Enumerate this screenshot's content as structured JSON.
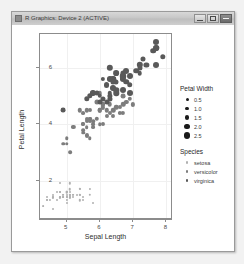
{
  "window": {
    "title": "R Graphics: Device 2 (ACTIVE)",
    "buttons": {
      "minimize": "Minimize",
      "maximize": "Maximize",
      "close": "Close"
    }
  },
  "legends": {
    "size": {
      "title": "Petal Width",
      "entries": [
        {
          "label": "0.5",
          "value": 0.5,
          "px": 3.0
        },
        {
          "label": "1.0",
          "value": 1.0,
          "px": 3.8
        },
        {
          "label": "1.5",
          "value": 1.5,
          "px": 4.6
        },
        {
          "label": "2.0",
          "value": 2.0,
          "px": 5.4
        },
        {
          "label": "2.5",
          "value": 2.5,
          "px": 6.2
        }
      ]
    },
    "color": {
      "title": "Species",
      "entries": [
        {
          "label": "setosa",
          "color": "#b0b0b0"
        },
        {
          "label": "versicolor",
          "color": "#7d7d7d"
        },
        {
          "label": "virginica",
          "color": "#595959"
        }
      ]
    }
  },
  "chart_data": {
    "type": "scatter",
    "title": "",
    "xlabel": "Sepal Length",
    "ylabel": "Petal Length",
    "xlim": [
      4.2,
      8.2
    ],
    "ylim": [
      0.6,
      7.2
    ],
    "xticks": [
      5,
      6,
      7,
      8
    ],
    "yticks": [
      2,
      4,
      6
    ],
    "grid": true,
    "legend_position": "right",
    "size_encoding": "Petal Width",
    "color_encoding": "Species",
    "series": [
      {
        "name": "setosa",
        "color": "#b0b0b0",
        "points": [
          {
            "x": 5.1,
            "y": 1.4,
            "w": 0.2
          },
          {
            "x": 4.9,
            "y": 1.4,
            "w": 0.2
          },
          {
            "x": 4.7,
            "y": 1.3,
            "w": 0.2
          },
          {
            "x": 4.6,
            "y": 1.5,
            "w": 0.2
          },
          {
            "x": 5.0,
            "y": 1.4,
            "w": 0.2
          },
          {
            "x": 5.4,
            "y": 1.7,
            "w": 0.4
          },
          {
            "x": 4.6,
            "y": 1.4,
            "w": 0.3
          },
          {
            "x": 5.0,
            "y": 1.5,
            "w": 0.2
          },
          {
            "x": 4.4,
            "y": 1.4,
            "w": 0.2
          },
          {
            "x": 4.9,
            "y": 1.5,
            "w": 0.1
          },
          {
            "x": 5.4,
            "y": 1.5,
            "w": 0.2
          },
          {
            "x": 4.8,
            "y": 1.6,
            "w": 0.2
          },
          {
            "x": 4.8,
            "y": 1.4,
            "w": 0.1
          },
          {
            "x": 4.3,
            "y": 1.1,
            "w": 0.1
          },
          {
            "x": 5.8,
            "y": 1.2,
            "w": 0.2
          },
          {
            "x": 5.7,
            "y": 1.5,
            "w": 0.4
          },
          {
            "x": 5.4,
            "y": 1.3,
            "w": 0.4
          },
          {
            "x": 5.1,
            "y": 1.4,
            "w": 0.3
          },
          {
            "x": 5.7,
            "y": 1.7,
            "w": 0.3
          },
          {
            "x": 5.1,
            "y": 1.5,
            "w": 0.3
          },
          {
            "x": 5.4,
            "y": 1.7,
            "w": 0.2
          },
          {
            "x": 5.1,
            "y": 1.5,
            "w": 0.4
          },
          {
            "x": 4.6,
            "y": 1.0,
            "w": 0.2
          },
          {
            "x": 5.1,
            "y": 1.7,
            "w": 0.5
          },
          {
            "x": 4.8,
            "y": 1.9,
            "w": 0.2
          },
          {
            "x": 5.0,
            "y": 1.6,
            "w": 0.2
          },
          {
            "x": 5.0,
            "y": 1.6,
            "w": 0.4
          },
          {
            "x": 5.2,
            "y": 1.5,
            "w": 0.2
          },
          {
            "x": 5.2,
            "y": 1.4,
            "w": 0.2
          },
          {
            "x": 4.7,
            "y": 1.6,
            "w": 0.2
          },
          {
            "x": 4.8,
            "y": 1.6,
            "w": 0.2
          },
          {
            "x": 5.4,
            "y": 1.5,
            "w": 0.4
          },
          {
            "x": 5.2,
            "y": 1.5,
            "w": 0.1
          },
          {
            "x": 5.5,
            "y": 1.4,
            "w": 0.2
          },
          {
            "x": 4.9,
            "y": 1.5,
            "w": 0.2
          },
          {
            "x": 5.0,
            "y": 1.2,
            "w": 0.2
          },
          {
            "x": 5.5,
            "y": 1.3,
            "w": 0.2
          },
          {
            "x": 4.9,
            "y": 1.4,
            "w": 0.1
          },
          {
            "x": 4.4,
            "y": 1.3,
            "w": 0.2
          },
          {
            "x": 5.1,
            "y": 1.5,
            "w": 0.2
          },
          {
            "x": 5.0,
            "y": 1.3,
            "w": 0.3
          },
          {
            "x": 4.5,
            "y": 1.3,
            "w": 0.3
          },
          {
            "x": 4.4,
            "y": 1.3,
            "w": 0.2
          },
          {
            "x": 5.0,
            "y": 1.6,
            "w": 0.6
          },
          {
            "x": 5.1,
            "y": 1.9,
            "w": 0.4
          },
          {
            "x": 4.8,
            "y": 1.4,
            "w": 0.3
          },
          {
            "x": 5.1,
            "y": 1.6,
            "w": 0.2
          },
          {
            "x": 4.6,
            "y": 1.4,
            "w": 0.2
          },
          {
            "x": 5.3,
            "y": 1.5,
            "w": 0.2
          },
          {
            "x": 5.0,
            "y": 1.4,
            "w": 0.2
          }
        ]
      },
      {
        "name": "versicolor",
        "color": "#7d7d7d",
        "points": [
          {
            "x": 7.0,
            "y": 4.7,
            "w": 1.4
          },
          {
            "x": 6.4,
            "y": 4.5,
            "w": 1.5
          },
          {
            "x": 6.9,
            "y": 4.9,
            "w": 1.5
          },
          {
            "x": 5.5,
            "y": 4.0,
            "w": 1.3
          },
          {
            "x": 6.5,
            "y": 4.6,
            "w": 1.5
          },
          {
            "x": 5.7,
            "y": 4.5,
            "w": 1.3
          },
          {
            "x": 6.3,
            "y": 4.7,
            "w": 1.6
          },
          {
            "x": 4.9,
            "y": 3.3,
            "w": 1.0
          },
          {
            "x": 6.6,
            "y": 4.6,
            "w": 1.3
          },
          {
            "x": 5.2,
            "y": 3.9,
            "w": 1.4
          },
          {
            "x": 5.0,
            "y": 3.5,
            "w": 1.0
          },
          {
            "x": 5.9,
            "y": 4.2,
            "w": 1.5
          },
          {
            "x": 6.0,
            "y": 4.0,
            "w": 1.0
          },
          {
            "x": 6.1,
            "y": 4.7,
            "w": 1.4
          },
          {
            "x": 5.6,
            "y": 3.6,
            "w": 1.3
          },
          {
            "x": 6.7,
            "y": 4.4,
            "w": 1.4
          },
          {
            "x": 5.6,
            "y": 4.5,
            "w": 1.5
          },
          {
            "x": 5.8,
            "y": 4.1,
            "w": 1.0
          },
          {
            "x": 6.2,
            "y": 4.5,
            "w": 1.5
          },
          {
            "x": 5.6,
            "y": 3.9,
            "w": 1.1
          },
          {
            "x": 5.9,
            "y": 4.8,
            "w": 1.8
          },
          {
            "x": 6.1,
            "y": 4.0,
            "w": 1.3
          },
          {
            "x": 6.3,
            "y": 4.9,
            "w": 1.5
          },
          {
            "x": 6.1,
            "y": 4.7,
            "w": 1.2
          },
          {
            "x": 6.4,
            "y": 4.3,
            "w": 1.3
          },
          {
            "x": 6.6,
            "y": 4.4,
            "w": 1.4
          },
          {
            "x": 6.8,
            "y": 4.8,
            "w": 1.4
          },
          {
            "x": 6.7,
            "y": 5.0,
            "w": 1.7
          },
          {
            "x": 6.0,
            "y": 4.5,
            "w": 1.5
          },
          {
            "x": 5.7,
            "y": 3.5,
            "w": 1.0
          },
          {
            "x": 5.5,
            "y": 3.8,
            "w": 1.1
          },
          {
            "x": 5.5,
            "y": 3.7,
            "w": 1.0
          },
          {
            "x": 5.8,
            "y": 3.9,
            "w": 1.2
          },
          {
            "x": 6.0,
            "y": 5.1,
            "w": 1.6
          },
          {
            "x": 5.4,
            "y": 4.5,
            "w": 1.5
          },
          {
            "x": 6.0,
            "y": 4.5,
            "w": 1.6
          },
          {
            "x": 6.7,
            "y": 4.7,
            "w": 1.5
          },
          {
            "x": 6.3,
            "y": 4.4,
            "w": 1.3
          },
          {
            "x": 5.6,
            "y": 4.1,
            "w": 1.3
          },
          {
            "x": 5.5,
            "y": 4.0,
            "w": 1.3
          },
          {
            "x": 5.5,
            "y": 4.4,
            "w": 1.2
          },
          {
            "x": 6.1,
            "y": 4.6,
            "w": 1.4
          },
          {
            "x": 5.8,
            "y": 4.0,
            "w": 1.2
          },
          {
            "x": 5.0,
            "y": 3.3,
            "w": 1.0
          },
          {
            "x": 5.6,
            "y": 4.2,
            "w": 1.3
          },
          {
            "x": 5.7,
            "y": 4.2,
            "w": 1.2
          },
          {
            "x": 5.7,
            "y": 4.2,
            "w": 1.3
          },
          {
            "x": 6.2,
            "y": 4.3,
            "w": 1.3
          },
          {
            "x": 5.1,
            "y": 3.0,
            "w": 1.1
          },
          {
            "x": 5.7,
            "y": 4.1,
            "w": 1.3
          }
        ]
      },
      {
        "name": "virginica",
        "color": "#595959",
        "points": [
          {
            "x": 6.3,
            "y": 6.0,
            "w": 2.5
          },
          {
            "x": 5.8,
            "y": 5.1,
            "w": 1.9
          },
          {
            "x": 7.1,
            "y": 5.9,
            "w": 2.1
          },
          {
            "x": 6.3,
            "y": 5.6,
            "w": 1.8
          },
          {
            "x": 6.5,
            "y": 5.8,
            "w": 2.2
          },
          {
            "x": 7.6,
            "y": 6.6,
            "w": 2.1
          },
          {
            "x": 4.9,
            "y": 4.5,
            "w": 1.7
          },
          {
            "x": 7.3,
            "y": 6.3,
            "w": 1.8
          },
          {
            "x": 6.7,
            "y": 5.8,
            "w": 1.8
          },
          {
            "x": 7.2,
            "y": 6.1,
            "w": 2.5
          },
          {
            "x": 6.5,
            "y": 5.1,
            "w": 2.0
          },
          {
            "x": 6.4,
            "y": 5.3,
            "w": 1.9
          },
          {
            "x": 6.8,
            "y": 5.5,
            "w": 2.1
          },
          {
            "x": 5.7,
            "y": 5.0,
            "w": 2.0
          },
          {
            "x": 5.8,
            "y": 5.1,
            "w": 2.4
          },
          {
            "x": 6.4,
            "y": 5.3,
            "w": 2.3
          },
          {
            "x": 6.5,
            "y": 5.5,
            "w": 1.8
          },
          {
            "x": 7.7,
            "y": 6.7,
            "w": 2.2
          },
          {
            "x": 7.7,
            "y": 6.9,
            "w": 2.3
          },
          {
            "x": 6.0,
            "y": 5.0,
            "w": 1.5
          },
          {
            "x": 6.9,
            "y": 5.7,
            "w": 2.3
          },
          {
            "x": 5.6,
            "y": 4.9,
            "w": 2.0
          },
          {
            "x": 7.7,
            "y": 6.7,
            "w": 2.0
          },
          {
            "x": 6.3,
            "y": 4.9,
            "w": 1.8
          },
          {
            "x": 6.7,
            "y": 5.7,
            "w": 2.1
          },
          {
            "x": 7.2,
            "y": 6.0,
            "w": 1.8
          },
          {
            "x": 6.2,
            "y": 4.8,
            "w": 1.8
          },
          {
            "x": 6.1,
            "y": 4.9,
            "w": 1.8
          },
          {
            "x": 6.4,
            "y": 5.6,
            "w": 2.1
          },
          {
            "x": 7.2,
            "y": 5.8,
            "w": 1.6
          },
          {
            "x": 7.4,
            "y": 6.1,
            "w": 1.9
          },
          {
            "x": 7.9,
            "y": 6.4,
            "w": 2.0
          },
          {
            "x": 6.4,
            "y": 5.6,
            "w": 2.2
          },
          {
            "x": 6.3,
            "y": 5.1,
            "w": 1.5
          },
          {
            "x": 6.1,
            "y": 5.6,
            "w": 1.4
          },
          {
            "x": 7.7,
            "y": 6.1,
            "w": 2.3
          },
          {
            "x": 6.3,
            "y": 5.6,
            "w": 2.4
          },
          {
            "x": 6.4,
            "y": 5.5,
            "w": 1.8
          },
          {
            "x": 6.0,
            "y": 4.8,
            "w": 1.8
          },
          {
            "x": 6.9,
            "y": 5.4,
            "w": 2.1
          },
          {
            "x": 6.7,
            "y": 5.6,
            "w": 2.4
          },
          {
            "x": 6.9,
            "y": 5.1,
            "w": 2.3
          },
          {
            "x": 5.8,
            "y": 5.1,
            "w": 1.9
          },
          {
            "x": 6.8,
            "y": 5.9,
            "w": 2.3
          },
          {
            "x": 6.7,
            "y": 5.7,
            "w": 2.5
          },
          {
            "x": 6.7,
            "y": 5.2,
            "w": 2.3
          },
          {
            "x": 6.3,
            "y": 5.0,
            "w": 1.9
          },
          {
            "x": 6.5,
            "y": 5.2,
            "w": 2.0
          },
          {
            "x": 6.2,
            "y": 5.4,
            "w": 2.3
          },
          {
            "x": 5.9,
            "y": 5.1,
            "w": 1.8
          }
        ]
      }
    ]
  }
}
